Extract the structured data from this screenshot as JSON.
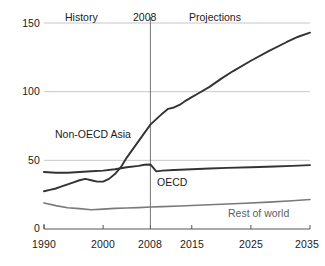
{
  "chart_data": {
    "type": "line",
    "title": "",
    "subtitle": "",
    "xlabel": "",
    "ylabel": "",
    "xlim": [
      1990,
      2035
    ],
    "ylim": [
      0,
      150
    ],
    "grid": true,
    "legend_position": "inline-annotations",
    "xticks": [
      1990,
      2000,
      2008,
      2015,
      2025,
      2035
    ],
    "xtick_labels": [
      "1990",
      "2000",
      "2008",
      "2015",
      "2025",
      "2035"
    ],
    "yticks": [
      0,
      50,
      100,
      150
    ],
    "ytick_labels": [
      "0",
      "50",
      "100",
      "150"
    ],
    "region_labels": [
      {
        "text": "History",
        "x": 1996
      },
      {
        "text": "2008",
        "x": 2008
      },
      {
        "text": "Projections",
        "x": 2020
      }
    ],
    "divider_year": 2008,
    "series": [
      {
        "name": "Non-OECD Asia",
        "color": "#333333",
        "width": 1.9,
        "label_x": 1992.5,
        "label_y": 76,
        "x": [
          1990,
          1991,
          1992,
          1993,
          1994,
          1995,
          1996,
          1997,
          1998,
          1999,
          2000,
          2001,
          2002,
          2003,
          2004,
          2005,
          2006,
          2007,
          2008,
          2009,
          2010,
          2011,
          2012,
          2013,
          2014,
          2015,
          2016,
          2018,
          2020,
          2022,
          2025,
          2028,
          2031,
          2033,
          2035
        ],
        "values": [
          27.5,
          28.5,
          29.5,
          31.0,
          32.5,
          34.0,
          35.5,
          36.5,
          35.5,
          34.5,
          34.5,
          36.5,
          40.0,
          45.0,
          52.0,
          58.0,
          64.0,
          70.0,
          76.0,
          80.0,
          84.0,
          87.5,
          88.5,
          90.5,
          93.5,
          96.0,
          98.5,
          103.5,
          109.5,
          115.0,
          122.5,
          129.5,
          136.0,
          140.0,
          143.0
        ]
      },
      {
        "name": "OECD",
        "color": "#333333",
        "width": 1.9,
        "label_x": 2011,
        "label_y": 33,
        "x": [
          1990,
          1992,
          1994,
          1996,
          1998,
          2000,
          2002,
          2004,
          2006,
          2007,
          2008,
          2009,
          2010,
          2012,
          2015,
          2018,
          2021,
          2025,
          2029,
          2032,
          2035
        ],
        "values": [
          41.5,
          41.0,
          41.0,
          41.5,
          42.0,
          42.5,
          43.5,
          45.0,
          46.0,
          46.8,
          47.0,
          42.0,
          42.5,
          43.0,
          43.5,
          44.0,
          44.5,
          45.0,
          45.5,
          46.0,
          46.5
        ]
      },
      {
        "name": "Rest of world",
        "color": "#7a7a7a",
        "width": 1.6,
        "label_x": 2022,
        "label_y": 8,
        "x": [
          1990,
          1992,
          1994,
          1996,
          1998,
          2000,
          2002,
          2004,
          2006,
          2008,
          2010,
          2013,
          2016,
          2020,
          2024,
          2028,
          2032,
          2035
        ],
        "values": [
          19.0,
          17.0,
          15.5,
          14.8,
          14.0,
          14.5,
          15.0,
          15.3,
          15.6,
          16.0,
          16.3,
          16.8,
          17.3,
          18.0,
          18.8,
          19.6,
          20.6,
          21.5
        ]
      }
    ]
  },
  "axis": {
    "y_axis_name": "y-axis",
    "x_axis_name": "x-axis"
  }
}
